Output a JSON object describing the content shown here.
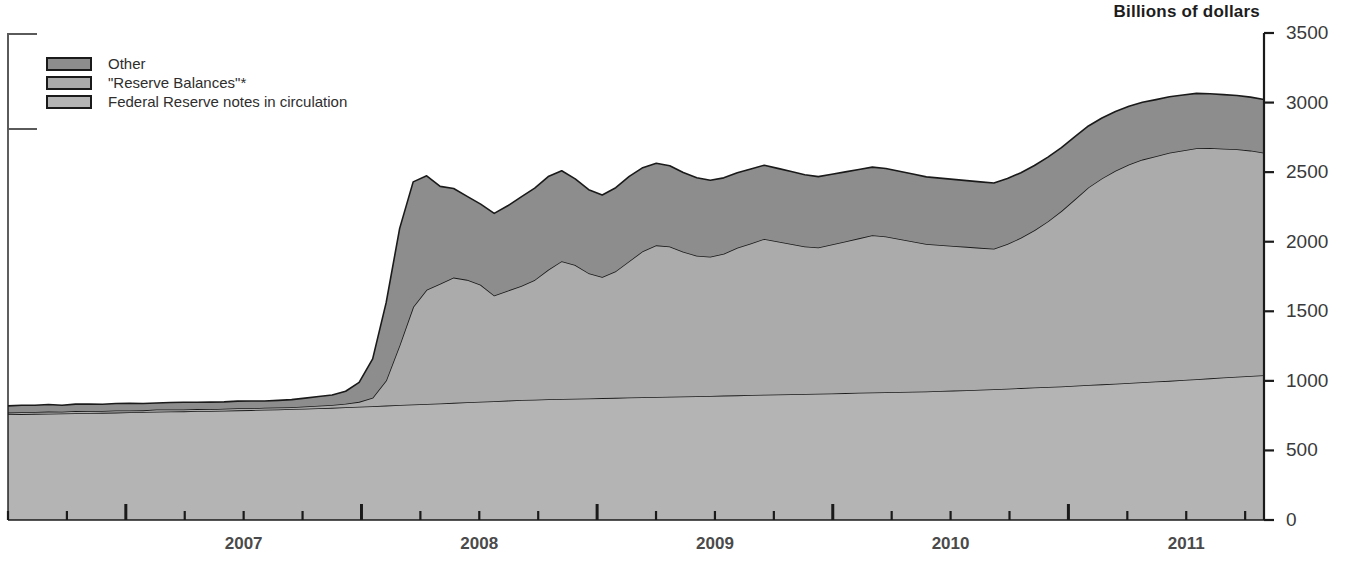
{
  "chart_data": {
    "type": "area",
    "title": "Billions of dollars",
    "subtitle": "",
    "xlabel": "",
    "ylabel": "Billions of dollars",
    "stacked": true,
    "grid": false,
    "legend_position": "top-left",
    "xlim": [
      2006.5,
      2011.83
    ],
    "ylim": [
      0,
      3500
    ],
    "y_ticks": [
      0,
      500,
      1000,
      1500,
      2000,
      2500,
      3000,
      3500
    ],
    "x_ticks": [
      2007,
      2008,
      2009,
      2010,
      2011
    ],
    "x_tick_labels": [
      "2007",
      "2008",
      "2009",
      "2010",
      "2011"
    ],
    "x_minor_ticks_per_year": 4,
    "colors": {
      "other": "#8d8d8d",
      "reserve_balances": "#ababab",
      "federal_reserve_notes": "#b4b4b4",
      "outline": "#1a1a1a",
      "axis": "#1a1a1a"
    },
    "series": [
      {
        "name": "Federal Reserve notes in circulation",
        "color": "#b4b4b4",
        "values": [
          760,
          761,
          763,
          764,
          766,
          767,
          769,
          770,
          772,
          774,
          776,
          778,
          780,
          781,
          783,
          784,
          786,
          788,
          790,
          792,
          795,
          798,
          800,
          803,
          806,
          810,
          814,
          818,
          822,
          826,
          830,
          834,
          838,
          842,
          846,
          850,
          854,
          858,
          862,
          865,
          868,
          870,
          872,
          874,
          876,
          878,
          880,
          882,
          884,
          886,
          888,
          890,
          892,
          894,
          896,
          898,
          900,
          902,
          904,
          906,
          908,
          910,
          912,
          914,
          916,
          918,
          920,
          922,
          924,
          927,
          930,
          933,
          936,
          940,
          944,
          948,
          952,
          956,
          960,
          965,
          970,
          975,
          980,
          985,
          990,
          995,
          1000,
          1006,
          1012,
          1018,
          1024,
          1030,
          1035,
          1040
        ]
      },
      {
        "name": "\"Reserve Balances\"*",
        "color": "#ababab",
        "values": [
          12,
          14,
          13,
          15,
          12,
          16,
          13,
          14,
          15,
          13,
          12,
          16,
          14,
          13,
          15,
          12,
          14,
          16,
          13,
          15,
          14,
          12,
          16,
          18,
          20,
          25,
          35,
          60,
          180,
          430,
          700,
          820,
          860,
          900,
          880,
          840,
          760,
          790,
          820,
          860,
          930,
          990,
          960,
          900,
          870,
          910,
          980,
          1050,
          1090,
          1080,
          1040,
          1010,
          1000,
          1020,
          1060,
          1090,
          1120,
          1100,
          1080,
          1060,
          1050,
          1070,
          1090,
          1110,
          1130,
          1120,
          1100,
          1080,
          1060,
          1050,
          1040,
          1030,
          1020,
          1010,
          1040,
          1080,
          1130,
          1190,
          1260,
          1340,
          1420,
          1480,
          1530,
          1570,
          1600,
          1620,
          1640,
          1650,
          1660,
          1655,
          1645,
          1635,
          1620,
          1600
        ]
      },
      {
        "name": "Other",
        "color": "#8d8d8d",
        "values": [
          48,
          50,
          49,
          51,
          47,
          50,
          52,
          48,
          50,
          51,
          49,
          47,
          50,
          52,
          48,
          51,
          49,
          50,
          52,
          48,
          51,
          55,
          60,
          66,
          72,
          90,
          140,
          280,
          560,
          840,
          900,
          820,
          700,
          640,
          600,
          580,
          590,
          610,
          640,
          660,
          670,
          650,
          620,
          600,
          590,
          600,
          610,
          600,
          590,
          580,
          570,
          560,
          550,
          545,
          540,
          535,
          530,
          525,
          520,
          515,
          510,
          505,
          500,
          495,
          490,
          488,
          486,
          484,
          482,
          480,
          478,
          476,
          474,
          472,
          470,
          468,
          466,
          462,
          456,
          450,
          442,
          434,
          426,
          418,
          412,
          406,
          402,
          398,
          394,
          390,
          388,
          386,
          384,
          382
        ]
      }
    ],
    "annotations": [
      {
        "text": "Billions of dollars",
        "position": "top-right"
      }
    ]
  },
  "legend": {
    "items": [
      {
        "label": "Other",
        "color": "#8d8d8d"
      },
      {
        "label": "\"Reserve Balances\"*",
        "color": "#ababab"
      },
      {
        "label": "Federal Reserve notes in circulation",
        "color": "#b4b4b4"
      }
    ]
  },
  "axes": {
    "title_right": "Billions of dollars",
    "y_labels": [
      "3500",
      "3000",
      "2500",
      "2000",
      "1500",
      "1000",
      "500",
      "0"
    ],
    "x_labels": [
      "2007",
      "2008",
      "2009",
      "2010",
      "2011"
    ]
  }
}
